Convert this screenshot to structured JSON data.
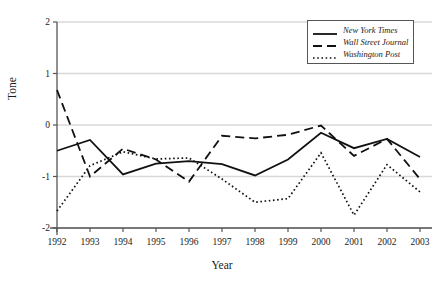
{
  "chart_data": {
    "type": "line",
    "title": "",
    "xlabel": "Year",
    "ylabel": "Tone",
    "grid": true,
    "legend_position": "top-right",
    "xlim": [
      1992,
      2003
    ],
    "ylim": [
      -2,
      2
    ],
    "x": [
      1992,
      1993,
      1994,
      1995,
      1996,
      1997,
      1998,
      1999,
      2000,
      2001,
      2002,
      2003
    ],
    "xticks": [
      "1992",
      "1993",
      "1994",
      "1995",
      "1996",
      "1997",
      "1998",
      "1999",
      "2000",
      "2001",
      "2002",
      "2003"
    ],
    "yticks": [
      "2",
      "1",
      "0",
      "-1",
      "-2"
    ],
    "ytick_values": [
      2,
      1,
      0,
      -1,
      -2
    ],
    "series": [
      {
        "name": "New York Times",
        "style": "solid",
        "color": "#111111",
        "values": [
          -0.5,
          -0.29,
          -0.96,
          -0.75,
          -0.7,
          -0.76,
          -0.98,
          -0.67,
          -0.15,
          -0.45,
          -0.27,
          -0.62
        ]
      },
      {
        "name": "Wall Street Journal",
        "style": "dashed",
        "color": "#111111",
        "values": [
          0.68,
          -1.0,
          -0.46,
          -0.67,
          -1.1,
          -0.21,
          -0.26,
          -0.19,
          -0.01,
          -0.6,
          -0.27,
          -1.05
        ]
      },
      {
        "name": "Washington Post",
        "style": "dotted",
        "color": "#111111",
        "values": [
          -1.67,
          -0.79,
          -0.52,
          -0.66,
          -0.64,
          -1.05,
          -1.5,
          -1.43,
          -0.54,
          -1.75,
          -0.77,
          -1.3
        ]
      }
    ]
  },
  "legend": {
    "entries": [
      {
        "label": "New York Times"
      },
      {
        "label": "Wall Street Journal"
      },
      {
        "label": "Washington Post"
      }
    ]
  },
  "axes": {
    "y_title": "Tone",
    "x_title": "Year"
  },
  "colors": {
    "axis": "#555555",
    "grid": "#d8d8d8",
    "line": "#111111",
    "text": "#1a1a1a"
  }
}
